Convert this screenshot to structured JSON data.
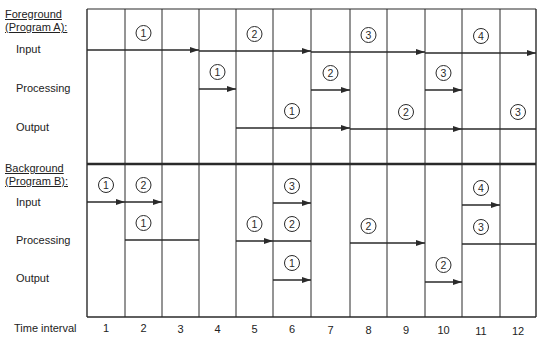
{
  "foreground": {
    "title_line1": "Foreground",
    "title_line2": "(Program A):",
    "rows": [
      "Input",
      "Processing",
      "Output"
    ]
  },
  "background": {
    "title_line1": "Background",
    "title_line2": "(Program B):",
    "rows": [
      "Input",
      "Processing",
      "Output"
    ]
  },
  "axis": {
    "label": "Time interval",
    "ticks": [
      "1",
      "2",
      "3",
      "4",
      "5",
      "6",
      "7",
      "8",
      "9",
      "10",
      "11",
      "12"
    ]
  },
  "grid": {
    "columns": [
      87,
      125,
      162,
      199,
      236,
      273,
      311,
      350,
      387,
      425,
      462,
      500,
      536
    ],
    "top": 9,
    "divider": 164,
    "bottom": 317,
    "fg_input_line": 50,
    "bg_input_line": 202
  },
  "segments": [
    {
      "section": "foreground",
      "row": "input",
      "label": "1",
      "from": 1,
      "to": 3,
      "y": 50,
      "arrow": true,
      "label_col": 2
    },
    {
      "section": "foreground",
      "row": "input",
      "label": "2",
      "from": 4,
      "to": 6,
      "y": 51,
      "arrow": true,
      "label_col": 5
    },
    {
      "section": "foreground",
      "row": "input",
      "label": "3",
      "from": 7,
      "to": 9,
      "y": 52,
      "arrow": true,
      "label_col": 8
    },
    {
      "section": "foreground",
      "row": "input",
      "label": "4",
      "from": 10,
      "to": 12,
      "y": 53,
      "arrow": true,
      "label_col": 11
    },
    {
      "section": "foreground",
      "row": "processing",
      "label": "1",
      "from": 4,
      "to": 4,
      "y": 89,
      "arrow": true,
      "label_col": 4
    },
    {
      "section": "foreground",
      "row": "processing",
      "label": "2",
      "from": 7,
      "to": 7,
      "y": 90,
      "arrow": true,
      "label_col": 7
    },
    {
      "section": "foreground",
      "row": "processing",
      "label": "3",
      "from": 10,
      "to": 10,
      "y": 90,
      "arrow": true,
      "label_col": 10
    },
    {
      "section": "foreground",
      "row": "output",
      "label": "1",
      "from": 5,
      "to": 7,
      "y": 128,
      "arrow": true,
      "label_col": 6
    },
    {
      "section": "foreground",
      "row": "output",
      "label": "2",
      "from": 8,
      "to": 10,
      "y": 129,
      "arrow": true,
      "label_col": 9
    },
    {
      "section": "foreground",
      "row": "output",
      "label": "3",
      "from": 11,
      "to": 12,
      "y": 129,
      "arrow": false,
      "label_col": 12
    },
    {
      "section": "background",
      "row": "input",
      "label": "1",
      "from": 1,
      "to": 1,
      "y": 202,
      "arrow": true,
      "label_col": 1
    },
    {
      "section": "background",
      "row": "input",
      "label": "2",
      "from": 2,
      "to": 2,
      "y": 202,
      "arrow": true,
      "label_col": 2
    },
    {
      "section": "background",
      "row": "input",
      "label": "3",
      "from": 6,
      "to": 6,
      "y": 203,
      "arrow": true,
      "label_col": 6
    },
    {
      "section": "background",
      "row": "input",
      "label": "4",
      "from": 11,
      "to": 11,
      "y": 205,
      "arrow": true,
      "label_col": 11
    },
    {
      "section": "background",
      "row": "processing",
      "label": "1",
      "from": 2,
      "to": 3,
      "y": 240,
      "arrow": false,
      "label_col": 2
    },
    {
      "section": "background",
      "row": "processing",
      "label": "1",
      "from": 5,
      "to": 5,
      "y": 241,
      "arrow": true,
      "label_col": 5
    },
    {
      "section": "background",
      "row": "processing",
      "label": "2",
      "from": 6,
      "to": 6,
      "y": 241,
      "arrow": false,
      "label_col": 6
    },
    {
      "section": "background",
      "row": "processing",
      "label": "2",
      "from": 8,
      "to": 9,
      "y": 243,
      "arrow": true,
      "label_col": 8
    },
    {
      "section": "background",
      "row": "processing",
      "label": "3",
      "from": 11,
      "to": 12,
      "y": 244,
      "arrow": false,
      "label_col": 11
    },
    {
      "section": "background",
      "row": "output",
      "label": "1",
      "from": 6,
      "to": 6,
      "y": 280,
      "arrow": true,
      "label_col": 6
    },
    {
      "section": "background",
      "row": "output",
      "label": "2",
      "from": 10,
      "to": 10,
      "y": 282,
      "arrow": true,
      "label_col": 10
    }
  ]
}
